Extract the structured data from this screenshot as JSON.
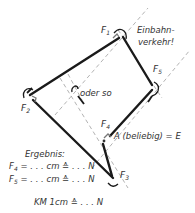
{
  "diagram": {
    "type": "force-polygon",
    "colors": {
      "ink": "#1a1a1a",
      "construction": "#9a9a9a",
      "text": "#333333"
    },
    "forces": {
      "F1": "F",
      "F1_sub": "1",
      "F2": "F",
      "F2_sub": "2",
      "F3": "F",
      "F3_sub": "3",
      "F4": "F",
      "F4_sub": "4",
      "F5": "F",
      "F5_sub": "5"
    },
    "annotations": {
      "one_way_line1": "Einbahn-",
      "one_way_line2": "verkehr!",
      "alternative": "oder so",
      "point_a": "A (beliebig) = E"
    },
    "result": {
      "heading": "Ergebnis:",
      "row1_F": "F",
      "row1_sub": "4",
      "row1_rest": " = . . .  cm ≙ . . .  N",
      "row2_F": "F",
      "row2_sub": "5",
      "row2_rest": " = . . .  cm ≙ . . .  N"
    },
    "scale": {
      "label": "KM  1cm ≙ . . .  N"
    }
  }
}
